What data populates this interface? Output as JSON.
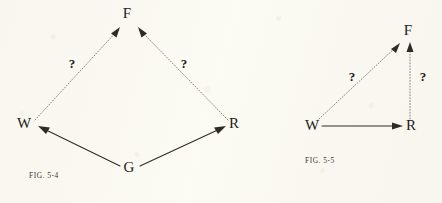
{
  "page": {
    "background_color": "#fbfaf3",
    "ink_color": "#2e2a24",
    "dotted_edge_color": "#8d8879"
  },
  "figures": [
    {
      "id": "fig-5-4",
      "caption": "FIG. 5-4",
      "caption_pos": {
        "x": 29,
        "y": 176
      },
      "shape": "diamond",
      "nodes": [
        {
          "id": "F",
          "label": "F",
          "x": 127,
          "y": 18
        },
        {
          "id": "W",
          "label": "W",
          "x": 24,
          "y": 128
        },
        {
          "id": "R",
          "label": "R",
          "x": 234,
          "y": 128
        },
        {
          "id": "G",
          "label": "G",
          "x": 129,
          "y": 172
        }
      ],
      "edges": [
        {
          "id": "G-to-W",
          "from": "G",
          "to": "W",
          "style": "solid",
          "arrow": true,
          "label": ""
        },
        {
          "id": "G-to-R",
          "from": "G",
          "to": "R",
          "style": "solid",
          "arrow": true,
          "label": ""
        },
        {
          "id": "W-to-F",
          "from": "W",
          "to": "F",
          "style": "dotted",
          "arrow": true,
          "label": "?"
        },
        {
          "id": "R-to-F",
          "from": "R",
          "to": "F",
          "style": "dotted",
          "arrow": true,
          "label": "?"
        }
      ],
      "edge_labels": [
        {
          "id": "q-left",
          "text": "?",
          "x": 72,
          "y": 68
        },
        {
          "id": "q-right",
          "text": "?",
          "x": 184,
          "y": 68
        }
      ]
    },
    {
      "id": "fig-5-5",
      "caption": "FIG. 5-5",
      "caption_pos": {
        "x": 305,
        "y": 161
      },
      "shape": "triangle",
      "nodes": [
        {
          "id": "F",
          "label": "F",
          "x": 408,
          "y": 35
        },
        {
          "id": "W",
          "label": "W",
          "x": 312,
          "y": 130
        },
        {
          "id": "R",
          "label": "R",
          "x": 411,
          "y": 130
        }
      ],
      "edges": [
        {
          "id": "W-to-R",
          "from": "W",
          "to": "R",
          "style": "solid",
          "arrow": true,
          "label": ""
        },
        {
          "id": "W-to-F",
          "from": "W",
          "to": "F",
          "style": "dotted",
          "arrow": true,
          "label": "?"
        },
        {
          "id": "R-to-F",
          "from": "R",
          "to": "F",
          "style": "dotted",
          "arrow": true,
          "label": "?"
        }
      ],
      "edge_labels": [
        {
          "id": "q-diagonal",
          "text": "?",
          "x": 352,
          "y": 81
        },
        {
          "id": "q-vertical",
          "text": "?",
          "x": 415,
          "y": 81
        }
      ]
    }
  ]
}
